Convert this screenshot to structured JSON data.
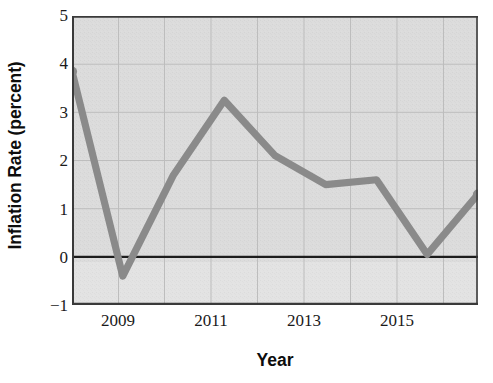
{
  "chart_data": {
    "type": "line",
    "title": "",
    "xlabel": "Year",
    "ylabel": "Inflation Rate (percent)",
    "x": [
      2008,
      2009,
      2010,
      2011,
      2012,
      2013,
      2014,
      2015,
      2016
    ],
    "values": [
      3.85,
      -0.4,
      1.7,
      3.25,
      2.1,
      1.5,
      1.6,
      0.05,
      1.3
    ],
    "series": [
      {
        "name": "Inflation Rate",
        "values": [
          3.85,
          -0.4,
          1.7,
          3.25,
          2.1,
          1.5,
          1.6,
          0.05,
          1.3
        ]
      }
    ],
    "xlim": [
      2008,
      2016
    ],
    "ylim": [
      -1,
      5
    ],
    "yticks": [
      "5",
      "4",
      "3",
      "2",
      "1",
      "0",
      "−1"
    ],
    "ytick_values": [
      5,
      4,
      3,
      2,
      1,
      0,
      -1
    ],
    "xticks": [
      "2009",
      "2011",
      "2013",
      "2015"
    ],
    "xtick_values": [
      2009,
      2011,
      2013,
      2015
    ],
    "grid": true,
    "legend": "none",
    "zero_line": 0,
    "colors": {
      "line": "#8a8a8a",
      "marker": "#8a8a8a",
      "plot_background": "#dcdcdc",
      "plot_background_lower": "#e2e2e2",
      "grid": "#b9b9b9",
      "axis": "#2a2a2a",
      "zero_line": "#1a1a1a",
      "text": "#1a1a1a",
      "label_text": "#0d0d0d"
    }
  }
}
